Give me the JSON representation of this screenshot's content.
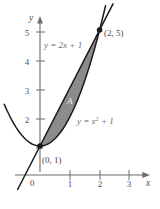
{
  "chart_data": {
    "type": "line",
    "title": "",
    "xlabel": "x",
    "ylabel": "y",
    "xlim": [
      -1.3,
      4.0
    ],
    "ylim": [
      -1.0,
      5.9
    ],
    "grid": false,
    "legend": "none",
    "x_ticks": [
      "1",
      "2",
      "3"
    ],
    "x_tick_values": [
      1,
      2,
      3
    ],
    "y_ticks": [
      "2",
      "3",
      "4",
      "5"
    ],
    "y_tick_values": [
      2,
      3,
      4,
      5
    ],
    "origin_label": "0",
    "series": [
      {
        "name": "y = 2x + 1",
        "type": "line",
        "equation": "y = 2x + 1",
        "label": "y = 2x + 1",
        "slope": 2,
        "intercept": 1,
        "x_range": [
          -0.75,
          2.45
        ]
      },
      {
        "name": "y = x^2 + 1",
        "type": "parabola",
        "equation": "y = x^2 + 1",
        "label_lhs": "y = x",
        "label_exp": "2",
        "label_rhs": "+ 1",
        "x_range": [
          -1.2,
          2.2
        ]
      }
    ],
    "shaded_region": {
      "label": "A",
      "between": [
        "y = 2x + 1",
        "y = x^2 + 1"
      ],
      "x_from": 0,
      "x_to": 2,
      "fill_color": "#8c8c8c"
    },
    "points": [
      {
        "label": "(2, 5)",
        "x": 2,
        "y": 5
      },
      {
        "label": "(0, 1)",
        "x": 0,
        "y": 1
      }
    ]
  },
  "labels": {
    "y_axis": "y",
    "x_axis": "x",
    "origin": "0",
    "line_eq": "y = 2x + 1",
    "parabola_eq_lhs": "y = x",
    "parabola_eq_exp": "2",
    "parabola_eq_rhs": "+ 1",
    "region": "A",
    "point_top": "(2, 5)",
    "point_bottom": "(0, 1)",
    "ytick_5": "5",
    "ytick_4": "4",
    "ytick_3": "3",
    "ytick_2": "2",
    "xtick_1": "1",
    "xtick_2": "2",
    "xtick_3": "3"
  },
  "colors": {
    "axis": "#6b6b6b",
    "curve": "#1a1a1a",
    "shade": "#8c8c8c",
    "text": "#4d4d4d",
    "label_gray": "#6e6e6e",
    "region_text": "#f2f2f2",
    "background": "#ffffff"
  }
}
